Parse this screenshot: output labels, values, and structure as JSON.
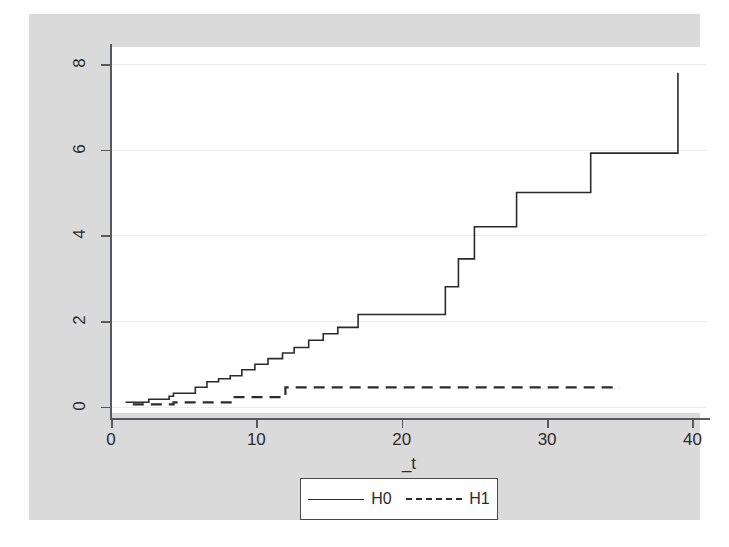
{
  "chart_data": {
    "type": "line",
    "subtype": "step",
    "title": "",
    "xlabel": "_t",
    "ylabel": "",
    "xlim": [
      0,
      41
    ],
    "ylim": [
      -0.15,
      8.4
    ],
    "xticks": [
      0,
      10,
      20,
      30,
      40
    ],
    "xtick_labels": [
      "0",
      "10",
      "20",
      "30",
      "40"
    ],
    "yticks": [
      0,
      2,
      4,
      6,
      8
    ],
    "ytick_labels": [
      "0",
      "2",
      "4",
      "6",
      "8"
    ],
    "grid": "horizontal",
    "legend_position": "below-center",
    "series": [
      {
        "name": "H0",
        "style": "solid",
        "color": "#2b2b2b",
        "x": [
          1.0,
          2.0,
          2.6,
          3.4,
          4.0,
          4.3,
          5.0,
          5.8,
          6.6,
          7.4,
          8.2,
          9.0,
          9.9,
          10.8,
          11.8,
          12.6,
          13.6,
          14.6,
          15.6,
          17.0,
          22.2,
          23.0,
          23.9,
          25.0,
          27.9,
          33.0,
          39.0
        ],
        "y": [
          0.1,
          0.1,
          0.17,
          0.17,
          0.24,
          0.31,
          0.31,
          0.45,
          0.58,
          0.65,
          0.72,
          0.86,
          0.99,
          1.12,
          1.25,
          1.38,
          1.55,
          1.7,
          1.85,
          2.15,
          2.15,
          2.8,
          3.45,
          4.2,
          5.0,
          5.92,
          7.8
        ]
      },
      {
        "name": "H1",
        "style": "dashed",
        "color": "#2b2b2b",
        "x": [
          1.5,
          3.5,
          4.3,
          7.8,
          8.4,
          12.0,
          35.0
        ],
        "y": [
          0.05,
          0.05,
          0.1,
          0.1,
          0.22,
          0.45,
          0.45
        ]
      }
    ]
  },
  "axis": {
    "x_title": "_t"
  },
  "legend": {
    "entries": [
      {
        "label": "H0",
        "style": "solid"
      },
      {
        "label": "H1",
        "style": "dashed"
      }
    ]
  },
  "colors": {
    "graph_region": "#dadada",
    "plot_background": "#ffffff",
    "gridline": "#ececec",
    "axis": "#555a5e",
    "series": "#2b2b2b"
  }
}
